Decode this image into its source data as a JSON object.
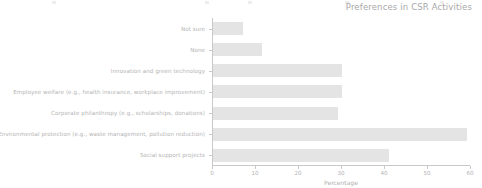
{
  "chart_data": {
    "type": "bar",
    "orientation": "horizontal",
    "title": "Preferences in CSR Activities",
    "xlabel": "Percentage",
    "ylabel": "",
    "xlim": [
      0,
      60
    ],
    "xticks": [
      0,
      10,
      20,
      30,
      40,
      50,
      60
    ],
    "xticklabels": [
      "0",
      "10",
      "20",
      "30",
      "40",
      "50",
      "60"
    ],
    "grid": false,
    "legend": false,
    "bar_color": "#e4e4e4",
    "axis_color": "#c9c9c9",
    "text_color": "#b4b4b4",
    "categories": [
      "Not sure",
      "None",
      "Innovation and green technology",
      "Employee welfare (e.g., health insurance, workplace improvement)",
      "Corporate philanthropy (e.g., scholarships, donations)",
      "Environmental protection (e.g., waste management, pollution reduction)",
      "Social support projects"
    ],
    "values": [
      7,
      11.5,
      30,
      30,
      29,
      59,
      41
    ]
  }
}
